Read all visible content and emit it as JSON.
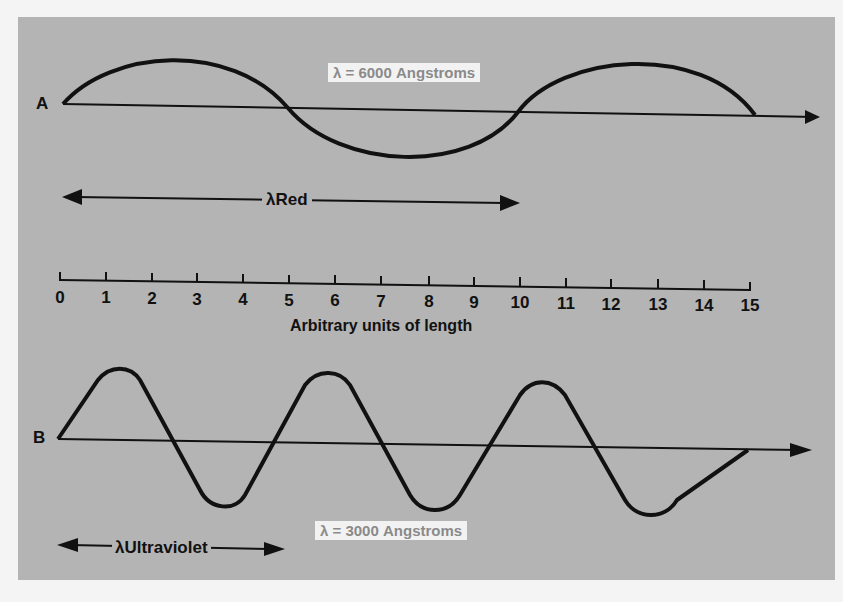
{
  "wave_a": {
    "label": "A",
    "wavelength_label": "λ = 6000 Angstroms",
    "span_label": "λRed",
    "wavelength_units": 10
  },
  "wave_b": {
    "label": "B",
    "wavelength_label": "λ = 3000 Angstroms",
    "span_label": "λUltraviolet",
    "wavelength_units": 5
  },
  "scale": {
    "title": "Arbitrary units of length",
    "ticks": [
      "0",
      "1",
      "2",
      "3",
      "4",
      "5",
      "6",
      "7",
      "8",
      "9",
      "10",
      "11",
      "12",
      "13",
      "14",
      "15"
    ]
  },
  "colors": {
    "panel": "#b4b4b4",
    "ink": "#111111",
    "label_box": "#f2f2f2",
    "label_text": "#8a8a8a"
  }
}
